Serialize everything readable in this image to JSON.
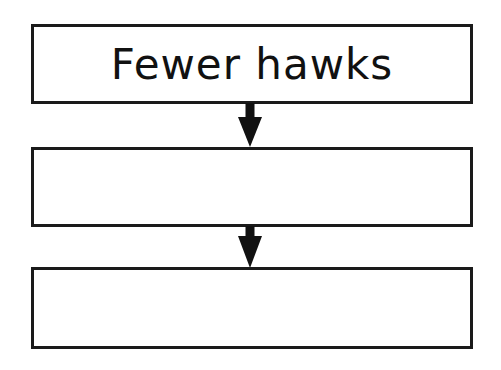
{
  "diagram": {
    "type": "flowchart",
    "boxes": [
      {
        "text": "Fewer hawks"
      },
      {
        "text": ""
      },
      {
        "text": ""
      }
    ],
    "arrows": [
      {
        "from": 0,
        "to": 1
      },
      {
        "from": 1,
        "to": 2
      }
    ]
  }
}
